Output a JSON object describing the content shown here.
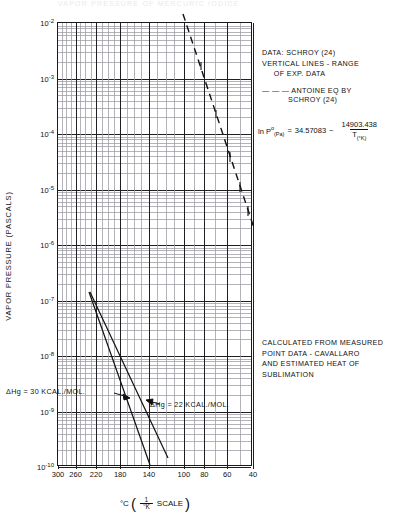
{
  "figure": {
    "faint_header": "VAPOR PRESSURE OF MERCURIC IODIDE",
    "y_axis_title": "VAPOR PRESSURE (PASCALS)",
    "x_axis_title_main": "°C",
    "x_axis_title_frac_num": "1",
    "x_axis_title_frac_den": "°K",
    "x_axis_title_scale": "SCALE"
  },
  "annotations": {
    "legend_block": "DATA: SCHROY (24)\nVERTICAL LINES - RANGE\n     OF EXP. DATA",
    "dash_key_line1": "— — — ANTOINE EQ BY",
    "dash_key_line2": "SCHROY (24)",
    "calc_block": "CALCULATED FROM MEASURED\nPOINT DATA - CAVALLARO\nAND ESTIMATED HEAT OF\nSUBLIMATION",
    "equation": {
      "lhs_ln": "ln P",
      "lhs_sup": "o",
      "lhs_sub": "(Pa)",
      "equals": "=",
      "intercept": "34.57083",
      "minus": "−",
      "numerator": "14903.438",
      "denominator": "T",
      "denominator_sub": "(°K)"
    },
    "delta_h_30": "ΔHg = 30 KCAL./MOL.",
    "delta_h_22": "ΔHg = 22 KCAL./MOL."
  },
  "chart_data": {
    "type": "line",
    "title": "VAPOR PRESSURE OF MERCURIC IODIDE",
    "xlabel": "°C (1/°K SCALE)",
    "ylabel": "VAPOR PRESSURE (PASCALS)",
    "x_scale": "reciprocal-temperature",
    "y_scale": "log10",
    "ylim": [
      1e-10,
      0.01
    ],
    "y_ticks": [
      "10⁻²",
      "10⁻³",
      "10⁻⁴",
      "10⁻⁵",
      "10⁻⁶",
      "10⁻⁷",
      "10⁻⁸",
      "10⁻⁹",
      "10⁻¹⁰"
    ],
    "y_tick_mantissa": [
      -2,
      -3,
      -4,
      -5,
      -6,
      -7,
      -8,
      -9,
      -10
    ],
    "x_ticks_celsius": [
      300,
      260,
      220,
      180,
      140,
      100,
      80,
      60,
      40
    ],
    "grid": true,
    "legend_position": "right",
    "series": [
      {
        "name": "ANTOINE EQ BY SCHROY (24)",
        "style": "dashed",
        "comment": "ln P(Pa) = 34.57083 - 14903.438/T(K)",
        "points_celsius_logp": [
          [
            250,
            -2.0
          ],
          [
            200,
            -3.35
          ],
          [
            160,
            -4.55
          ],
          [
            130,
            -5.6
          ],
          [
            112,
            -6.3
          ]
        ]
      },
      {
        "name": "ΔHg = 30 KCAL./MOL.",
        "style": "solid",
        "points_celsius_logp": [
          [
            193,
            -6.9
          ],
          [
            150,
            -8.35
          ],
          [
            138,
            -9.75
          ]
        ]
      },
      {
        "name": "ΔHg = 22 KCAL./MOL.",
        "style": "solid",
        "points_celsius_logp": [
          [
            193,
            -6.9
          ],
          [
            158,
            -8.4
          ],
          [
            146,
            -9.55
          ]
        ]
      }
    ]
  }
}
